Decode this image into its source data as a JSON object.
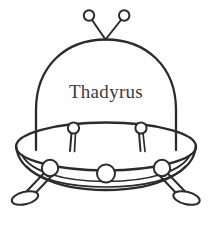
{
  "artwork": {
    "title": "Thadyrus",
    "subject": "flying-saucer-line-art",
    "style": "black-and-white-coloring-page",
    "background_color": "#fefefe",
    "ink_color": "#2b2b2f"
  },
  "nameplate": {
    "label": "Thadyrus"
  },
  "parts": {
    "dome_label": "cockpit-dome",
    "saucer_label": "saucer-body",
    "rim_label": "saucer-rim",
    "antenna_left_label": "left-antenna",
    "antenna_right_label": "right-antenna",
    "pin_left_label": "left-deck-pin",
    "pin_right_label": "right-deck-pin",
    "porthole_left_label": "left-porthole",
    "porthole_center_label": "center-porthole",
    "porthole_right_label": "right-porthole",
    "leg_left_label": "left-landing-leg",
    "leg_right_label": "right-landing-leg",
    "foot_left_label": "left-landing-foot",
    "foot_right_label": "right-landing-foot"
  },
  "counts": {
    "antennae": 2,
    "portholes": 3,
    "legs": 2,
    "deck_pins": 2
  }
}
